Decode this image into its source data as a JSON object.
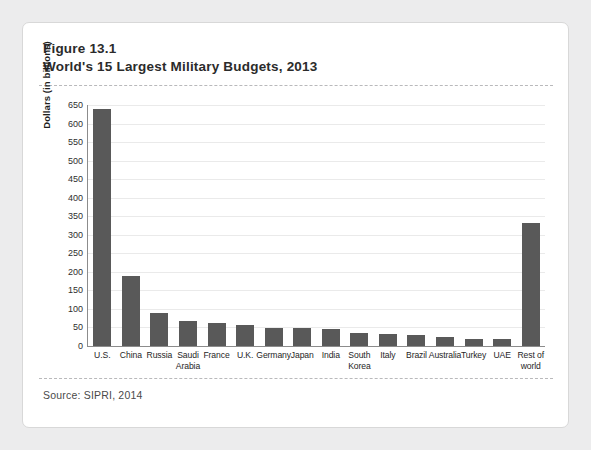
{
  "figure": {
    "label": "Figure 13.1",
    "title": "World's 15 Largest Military Budgets, 2013",
    "source": "Source: SIPRI, 2014"
  },
  "colors": {
    "bar": "#595959",
    "axis": "#8c8c8c",
    "grid": "#eaeaea",
    "page_background": "#ececed",
    "card_background": "#ffffff"
  },
  "chart_data": {
    "type": "bar",
    "title": "World's 15 Largest Military Budgets, 2013",
    "xlabel": "",
    "ylabel": "Dollars (in billions)",
    "ylim": [
      0,
      650
    ],
    "yticks": [
      0,
      50,
      100,
      150,
      200,
      250,
      300,
      350,
      400,
      450,
      500,
      550,
      600,
      650
    ],
    "grid": true,
    "legend": "none",
    "categories": [
      "U.S.",
      "China",
      "Russia",
      "Saudi Arabia",
      "France",
      "U.K.",
      "Germany",
      "Japan",
      "India",
      "South Korea",
      "Italy",
      "Brazil",
      "Australia",
      "Turkey",
      "UAE",
      "Rest of world"
    ],
    "values": [
      640,
      188,
      88,
      67,
      61,
      57,
      49,
      49,
      47,
      34,
      33,
      31,
      24,
      19,
      19,
      331
    ]
  }
}
